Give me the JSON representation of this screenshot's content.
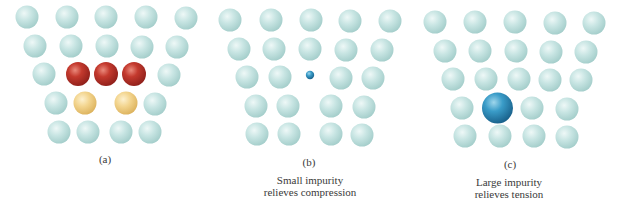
{
  "colors": {
    "host": "#c4e2e0",
    "substitutional_large": "#c0392b",
    "substitutional_small": "#f2d48a",
    "interstitial": "#2f8bbf"
  },
  "panels": [
    {
      "id": "a",
      "label": "(a)",
      "label_pos": [
        105,
        159
      ],
      "caption": [],
      "atoms": [
        {
          "x": 27,
          "y": 17,
          "r": 11.5,
          "type": "host"
        },
        {
          "x": 67,
          "y": 17,
          "r": 11.5,
          "type": "host"
        },
        {
          "x": 106,
          "y": 17,
          "r": 11.5,
          "type": "host"
        },
        {
          "x": 146,
          "y": 17,
          "r": 11.5,
          "type": "host"
        },
        {
          "x": 186,
          "y": 18,
          "r": 11.5,
          "type": "host"
        },
        {
          "x": 35,
          "y": 46,
          "r": 11.5,
          "type": "host"
        },
        {
          "x": 71,
          "y": 46,
          "r": 11.5,
          "type": "host"
        },
        {
          "x": 107,
          "y": 46,
          "r": 11.5,
          "type": "host"
        },
        {
          "x": 142,
          "y": 47,
          "r": 11.5,
          "type": "host"
        },
        {
          "x": 177,
          "y": 47,
          "r": 11.5,
          "type": "host"
        },
        {
          "x": 44,
          "y": 74,
          "r": 11.5,
          "type": "host"
        },
        {
          "x": 78,
          "y": 74,
          "r": 12,
          "type": "substitutional_large"
        },
        {
          "x": 106,
          "y": 74,
          "r": 12,
          "type": "substitutional_large"
        },
        {
          "x": 134,
          "y": 74,
          "r": 12,
          "type": "substitutional_large"
        },
        {
          "x": 169,
          "y": 75,
          "r": 11.5,
          "type": "host"
        },
        {
          "x": 56,
          "y": 103,
          "r": 11.5,
          "type": "host"
        },
        {
          "x": 85,
          "y": 103,
          "r": 11.5,
          "type": "substitutional_small"
        },
        {
          "x": 126,
          "y": 103,
          "r": 11.5,
          "type": "substitutional_small"
        },
        {
          "x": 155,
          "y": 104,
          "r": 11.5,
          "type": "host"
        },
        {
          "x": 59,
          "y": 132,
          "r": 11.5,
          "type": "host"
        },
        {
          "x": 88,
          "y": 132,
          "r": 11.5,
          "type": "host"
        },
        {
          "x": 121,
          "y": 132,
          "r": 11.5,
          "type": "host"
        },
        {
          "x": 150,
          "y": 132,
          "r": 11.5,
          "type": "host"
        }
      ]
    },
    {
      "id": "b",
      "label": "(b)",
      "label_pos": [
        309,
        162
      ],
      "caption": [
        "Small impurity",
        "relieves compression"
      ],
      "caption_pos": [
        310,
        186
      ],
      "atoms": [
        {
          "x": 230,
          "y": 20,
          "r": 11.5,
          "type": "host"
        },
        {
          "x": 271,
          "y": 20,
          "r": 11.5,
          "type": "host"
        },
        {
          "x": 311,
          "y": 20,
          "r": 11.5,
          "type": "host"
        },
        {
          "x": 350,
          "y": 21,
          "r": 11.5,
          "type": "host"
        },
        {
          "x": 390,
          "y": 21,
          "r": 11.5,
          "type": "host"
        },
        {
          "x": 239,
          "y": 49,
          "r": 11.5,
          "type": "host"
        },
        {
          "x": 274,
          "y": 49,
          "r": 11.5,
          "type": "host"
        },
        {
          "x": 310,
          "y": 49,
          "r": 11.5,
          "type": "host"
        },
        {
          "x": 346,
          "y": 50,
          "r": 11.5,
          "type": "host"
        },
        {
          "x": 382,
          "y": 50,
          "r": 11.5,
          "type": "host"
        },
        {
          "x": 247,
          "y": 77,
          "r": 11.5,
          "type": "host"
        },
        {
          "x": 280,
          "y": 77,
          "r": 11.5,
          "type": "host"
        },
        {
          "x": 310,
          "y": 75,
          "r": 4.2,
          "type": "interstitial"
        },
        {
          "x": 341,
          "y": 78,
          "r": 11.5,
          "type": "host"
        },
        {
          "x": 373,
          "y": 78,
          "r": 11.5,
          "type": "host"
        },
        {
          "x": 256,
          "y": 106,
          "r": 11.5,
          "type": "host"
        },
        {
          "x": 288,
          "y": 106,
          "r": 11.5,
          "type": "host"
        },
        {
          "x": 331,
          "y": 106,
          "r": 11.5,
          "type": "host"
        },
        {
          "x": 364,
          "y": 107,
          "r": 11.5,
          "type": "host"
        },
        {
          "x": 257,
          "y": 134,
          "r": 11.5,
          "type": "host"
        },
        {
          "x": 289,
          "y": 134,
          "r": 11.5,
          "type": "host"
        },
        {
          "x": 331,
          "y": 134,
          "r": 11.5,
          "type": "host"
        },
        {
          "x": 362,
          "y": 135,
          "r": 11.5,
          "type": "host"
        }
      ]
    },
    {
      "id": "c",
      "label": "(c)",
      "label_pos": [
        510,
        164
      ],
      "caption": [
        "Large impurity",
        "relieves tension"
      ],
      "caption_pos": [
        509,
        188
      ],
      "atoms": [
        {
          "x": 435,
          "y": 22,
          "r": 11.5,
          "type": "host"
        },
        {
          "x": 475,
          "y": 22,
          "r": 11.5,
          "type": "host"
        },
        {
          "x": 515,
          "y": 22,
          "r": 11.5,
          "type": "host"
        },
        {
          "x": 555,
          "y": 23,
          "r": 11.5,
          "type": "host"
        },
        {
          "x": 594,
          "y": 23,
          "r": 11.5,
          "type": "host"
        },
        {
          "x": 445,
          "y": 51,
          "r": 11.5,
          "type": "host"
        },
        {
          "x": 480,
          "y": 51,
          "r": 11.5,
          "type": "host"
        },
        {
          "x": 516,
          "y": 51,
          "r": 11.5,
          "type": "host"
        },
        {
          "x": 551,
          "y": 52,
          "r": 11.5,
          "type": "host"
        },
        {
          "x": 586,
          "y": 52,
          "r": 11.5,
          "type": "host"
        },
        {
          "x": 453,
          "y": 79,
          "r": 11.5,
          "type": "host"
        },
        {
          "x": 486,
          "y": 79,
          "r": 11.5,
          "type": "host"
        },
        {
          "x": 519,
          "y": 79,
          "r": 11.5,
          "type": "host"
        },
        {
          "x": 550,
          "y": 80,
          "r": 11.5,
          "type": "host"
        },
        {
          "x": 581,
          "y": 80,
          "r": 11.5,
          "type": "host"
        },
        {
          "x": 462,
          "y": 108,
          "r": 11.5,
          "type": "host"
        },
        {
          "x": 497.5,
          "y": 108,
          "r": 15.5,
          "type": "interstitial"
        },
        {
          "x": 532,
          "y": 108,
          "r": 11.5,
          "type": "host"
        },
        {
          "x": 567,
          "y": 109,
          "r": 11.5,
          "type": "host"
        },
        {
          "x": 465,
          "y": 136,
          "r": 11.5,
          "type": "host"
        },
        {
          "x": 500,
          "y": 136,
          "r": 11.5,
          "type": "host"
        },
        {
          "x": 534,
          "y": 136,
          "r": 11.5,
          "type": "host"
        },
        {
          "x": 567,
          "y": 137,
          "r": 11.5,
          "type": "host"
        }
      ]
    }
  ]
}
